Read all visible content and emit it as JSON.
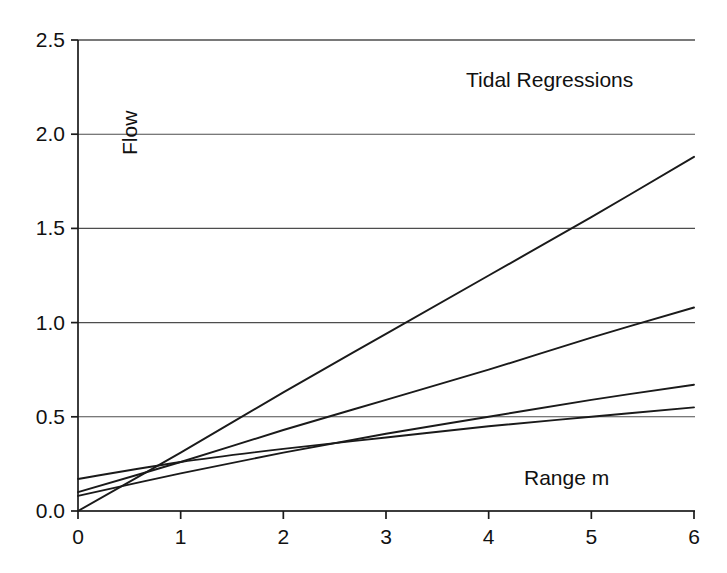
{
  "chart_data": {
    "type": "line",
    "title": "Tidal Regressions",
    "xlabel": "Range m",
    "ylabel": "Flow",
    "xlim": [
      0,
      6
    ],
    "ylim": [
      0.0,
      2.5
    ],
    "grid": true,
    "grid_axis": "y",
    "legend": "none",
    "xticks": [
      "0",
      "1",
      "2",
      "3",
      "4",
      "5",
      "6"
    ],
    "xtick_values": [
      0,
      1,
      2,
      3,
      4,
      5,
      6
    ],
    "yticks": [
      "0.0",
      "0.5",
      "1.0",
      "1.5",
      "2.0",
      "2.5"
    ],
    "ytick_values": [
      0.0,
      0.5,
      1.0,
      1.5,
      2.0,
      2.5
    ],
    "x": [
      0,
      1,
      2,
      3,
      4,
      5,
      6
    ],
    "series": [
      {
        "name": "regression-1",
        "intercept": 0.0,
        "values": [
          0.0,
          0.31,
          0.63,
          0.94,
          1.25,
          1.56,
          1.88
        ]
      },
      {
        "name": "regression-2",
        "intercept": 0.1,
        "values": [
          0.1,
          0.26,
          0.43,
          0.59,
          0.75,
          0.92,
          1.08
        ]
      },
      {
        "name": "regression-3",
        "intercept": 0.08,
        "values": [
          0.08,
          0.2,
          0.31,
          0.41,
          0.5,
          0.59,
          0.67
        ]
      },
      {
        "name": "regression-4",
        "intercept": 0.17,
        "values": [
          0.17,
          0.26,
          0.33,
          0.39,
          0.45,
          0.5,
          0.55
        ]
      }
    ],
    "colors": {
      "line": "#1a1a1a",
      "grid": "#4d4d4d",
      "axis": "#1a1a1a",
      "background": "#ffffff"
    }
  }
}
